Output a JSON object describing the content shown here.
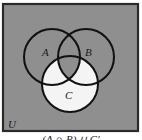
{
  "diagram": {
    "type": "venn",
    "universe_label": "U",
    "sets": [
      {
        "id": "A",
        "label": "A"
      },
      {
        "id": "B",
        "label": "B"
      },
      {
        "id": "C",
        "label": "C"
      }
    ],
    "shaded_expression": "(A ∩ B) ∪ C′",
    "caption": "(A ∩ B) ∪ C′",
    "colors": {
      "shaded": "#8f8f8f",
      "unshaded": "#f4f4f4",
      "stroke": "#111111",
      "frame": "#2a2a2a"
    }
  }
}
